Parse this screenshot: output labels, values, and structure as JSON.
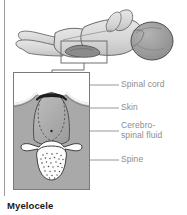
{
  "figure": {
    "caption": "Myelocele",
    "title_text": "Myelocele"
  },
  "labels": [
    {
      "id": "spinal-cord",
      "text": "Spinal cord",
      "x": 122,
      "y": 80,
      "leader_y": 85,
      "leader_x1": 90,
      "leader_x2": 119
    },
    {
      "id": "skin",
      "text": "Skin",
      "x": 122,
      "y": 104,
      "leader_y": 108,
      "leader_x1": 90,
      "leader_x2": 119
    },
    {
      "id": "cerebrospinal-fluid",
      "text": "Cerebro-\nspinal fluid",
      "x": 122,
      "y": 126,
      "leader_y": 131,
      "leader_x1": 90,
      "leader_x2": 119
    },
    {
      "id": "spine",
      "text": "Spine",
      "x": 122,
      "y": 156,
      "leader_y": 160,
      "leader_x1": 90,
      "leader_x2": 119
    }
  ],
  "colors": {
    "tissue_gray": "#a9a9a9",
    "body_fill": "#d8d8d8",
    "head_fill": "#9a9a9a",
    "lesion_fill": "#8e8e8e",
    "bone_white": "#fdfdfd",
    "cord_dark": "#2a2a2a",
    "outline": "#4a4a4a",
    "label_text": "#8d8d8d",
    "caption_text": "#1a1a1a",
    "rule": "#9a9a9a",
    "frame_border": "#7a7a7a"
  },
  "scene": {
    "infant": {
      "name": "prone-infant-illustration",
      "description": "Infant lying prone shown from behind with head to the right"
    },
    "callout_box": {
      "name": "callout-region-box",
      "x": 61,
      "y": 41,
      "width": 46,
      "height": 22
    },
    "detail_frame": {
      "name": "cross-section-frame",
      "x": 13,
      "y": 72,
      "width": 77,
      "height": 118
    },
    "vertebra": {
      "name": "vertebra-cross-section"
    },
    "sac": {
      "name": "myelocele-sac"
    }
  }
}
